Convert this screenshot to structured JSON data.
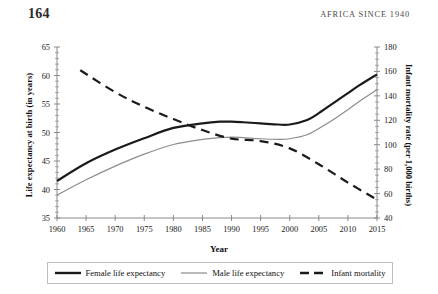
{
  "page": {
    "folio": "164",
    "running_head": "AFRICA SINCE 1940"
  },
  "figure": {
    "x_axis_title": "Year",
    "y_axis_left_title": "Life expectancy at birth (in years)",
    "y_axis_right_title": "Infant mortality rate (per 1,000 births)",
    "legend": [
      {
        "label": "Female life expectancy",
        "style": "solid-thick-black",
        "color": "#1a1a1a"
      },
      {
        "label": "Male life expectancy",
        "style": "solid-thin-gray",
        "color": "#8c8c8c"
      },
      {
        "label": "Infant mortality",
        "style": "dashed-black",
        "color": "#1a1a1a"
      }
    ]
  },
  "chart_data": {
    "type": "line",
    "title": "",
    "xlabel": "Year",
    "ylabel": "Life expectancy at birth (in years)",
    "ylabel_right": "Infant mortality rate (per 1,000 births)",
    "xlim": [
      1960,
      2015
    ],
    "ylim": [
      35,
      65
    ],
    "ylim_right": [
      40,
      180
    ],
    "xticks": [
      1960,
      1965,
      1970,
      1975,
      1980,
      1985,
      1990,
      1995,
      2000,
      2005,
      2010,
      2015
    ],
    "xticklabels": [
      "1960",
      "1965",
      "1970",
      "1975",
      "1980",
      "1985",
      "1990",
      "1995",
      "2000",
      "2005",
      "2010",
      "2015"
    ],
    "yticks_left": [
      35,
      40,
      45,
      50,
      55,
      60,
      65
    ],
    "yticklabels_left": [
      "35",
      "40",
      "45",
      "50",
      "55",
      "60",
      "65"
    ],
    "yticks_right": [
      40,
      60,
      80,
      100,
      120,
      140,
      160,
      180
    ],
    "yticklabels_right": [
      "40",
      "60",
      "80",
      "100",
      "120",
      "140",
      "160",
      "180"
    ],
    "grid": false,
    "legend_position": "below-plot",
    "series": [
      {
        "name": "Female life expectancy",
        "axis": "left",
        "color": "#1a1a1a",
        "width": 2.2,
        "dash": "none",
        "x": [
          1960,
          1965,
          1970,
          1975,
          1980,
          1985,
          1988,
          1990,
          1992,
          1995,
          1998,
          2000,
          2003,
          2005,
          2008,
          2010,
          2012,
          2015
        ],
        "values": [
          41.5,
          44.6,
          47.0,
          49.0,
          50.8,
          51.6,
          51.9,
          51.9,
          51.8,
          51.6,
          51.4,
          51.4,
          52.2,
          53.4,
          55.5,
          56.9,
          58.3,
          60.2
        ]
      },
      {
        "name": "Male life expectancy",
        "axis": "left",
        "color": "#8c8c8c",
        "width": 1.2,
        "dash": "none",
        "x": [
          1960,
          1965,
          1970,
          1975,
          1980,
          1985,
          1988,
          1990,
          1992,
          1995,
          1998,
          2000,
          2003,
          2005,
          2008,
          2010,
          2012,
          2015
        ],
        "values": [
          39.0,
          41.7,
          44.1,
          46.2,
          47.9,
          48.8,
          49.1,
          49.2,
          49.1,
          48.9,
          48.8,
          48.9,
          49.6,
          50.7,
          52.6,
          54.0,
          55.5,
          57.5
        ]
      },
      {
        "name": "Infant mortality",
        "axis": "right",
        "color": "#1a1a1a",
        "width": 2.2,
        "dash": "9 6",
        "x": [
          1964,
          1970,
          1975,
          1980,
          1985,
          1990,
          1995,
          2000,
          2005,
          2010,
          2015
        ],
        "values": [
          161,
          143,
          131,
          121,
          112,
          105,
          103,
          97,
          84,
          69,
          55
        ]
      }
    ]
  }
}
